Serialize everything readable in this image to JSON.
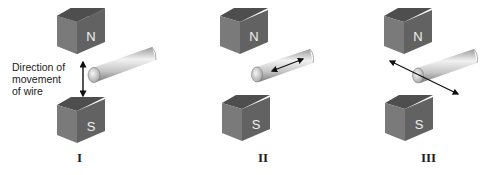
{
  "diagram": {
    "panels": [
      {
        "id": "I",
        "label": "I",
        "north_label": "N",
        "south_label": "S",
        "movement": "vertical",
        "annotation": [
          "Direction of",
          "movement",
          "of wire"
        ]
      },
      {
        "id": "II",
        "label": "II",
        "north_label": "N",
        "south_label": "S",
        "movement": "along-wire"
      },
      {
        "id": "III",
        "label": "III",
        "north_label": "N",
        "south_label": "S",
        "movement": "horizontal-perpendicular"
      }
    ],
    "colors": {
      "magnet_front": "#6a6a6a",
      "magnet_top": "#4a4a4a",
      "magnet_side": "#7c7c7c",
      "wire_light": "#e6e6e6",
      "wire_dark": "#8a8a8a",
      "arrow": "#111111"
    }
  }
}
